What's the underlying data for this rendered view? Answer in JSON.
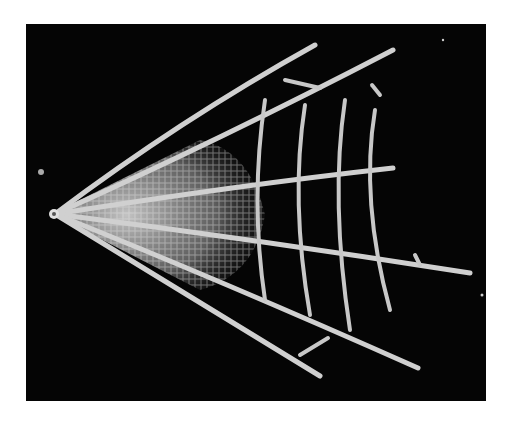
{
  "image": {
    "subject": "radiolarian skeleton (SEM micrograph)",
    "background_color": "#050505",
    "frame_color": "#ffffff"
  }
}
